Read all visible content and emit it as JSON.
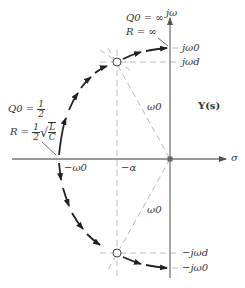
{
  "diagram": {
    "title": "Y(s)",
    "axes": {
      "vertical_label": "jω",
      "horizontal_label": "σ"
    },
    "tick_labels": {
      "j_omega0": "jω0",
      "j_omega_d": "jωd",
      "neg_j_omega_d": "−jωd",
      "neg_j_omega0": "−jω0",
      "neg_omega0": "−ω0",
      "neg_alpha": "−α"
    },
    "radius_labels": [
      "ω0",
      "ω0"
    ],
    "annotations": {
      "top": {
        "q_label": "Q0 = ∞",
        "r_label": "R = ∞"
      },
      "left": {
        "q_label": "Q0 =",
        "q_frac_num": "1",
        "q_frac_den": "2",
        "r_label": "R =",
        "r_frac_num": "1",
        "r_frac_den": "2",
        "sqrt_num": "L",
        "sqrt_den": "C"
      }
    },
    "colors": {
      "axis": "#777777",
      "locus": "#222222",
      "dashed": "#bbbbbb",
      "text": "#333333"
    }
  }
}
